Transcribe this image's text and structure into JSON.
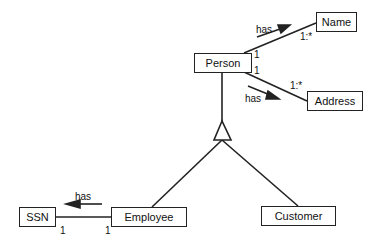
{
  "diagram": {
    "type": "UML class diagram",
    "classes": {
      "person": "Person",
      "name": "Name",
      "address": "Address",
      "employee": "Employee",
      "customer": "Customer",
      "ssn": "SSN"
    },
    "associations": [
      {
        "from": "Person",
        "to": "Name",
        "label": "has",
        "from_mult": "1",
        "to_mult": "1:*"
      },
      {
        "from": "Person",
        "to": "Address",
        "label": "has",
        "from_mult": "1",
        "to_mult": "1:*"
      },
      {
        "from": "Employee",
        "to": "SSN",
        "label": "has",
        "from_mult": "1",
        "to_mult": "1"
      }
    ],
    "generalization": {
      "parent": "Person",
      "children": [
        "Employee",
        "Customer"
      ]
    },
    "labels": {
      "has_name": "has",
      "has_address": "has",
      "has_ssn": "has",
      "mult_person_name": "1",
      "mult_name": "1:*",
      "mult_person_address": "1",
      "mult_address": "1:*",
      "mult_employee_ssn": "1",
      "mult_ssn": "1"
    }
  }
}
